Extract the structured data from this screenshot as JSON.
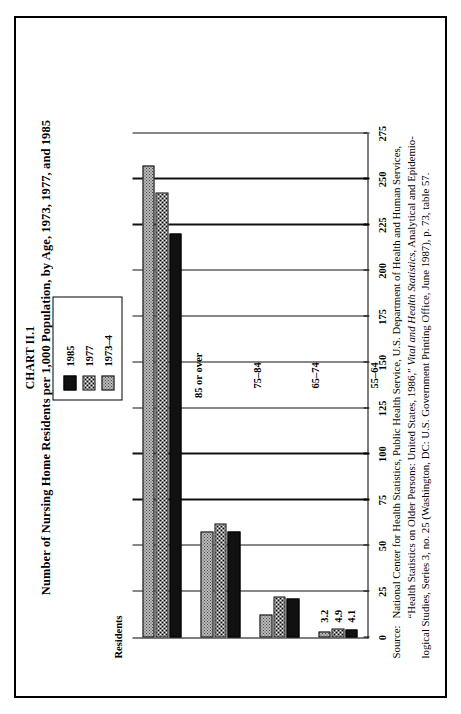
{
  "figure": {
    "chart_number": "CHART II.1",
    "title": "Number of Nursing Home Residents per 1,000 Population, by Age, 1973, 1977, and 1985",
    "axis_label": "Residents",
    "source_keyword": "Source:",
    "source_line1_a": "National Center for Health Statistics, Public Health Service, U.S. Department of Health and Human Services,",
    "source_line2_a": "“Health Statistics on Older Persons: United States, 1986,” ",
    "source_line2_italic": "Vital and Health Statistics",
    "source_line2_b": ", Analytical and Epidemio-",
    "source_line3_a": "logical Studies, Series 3, no. 25 (Washington, DC: U.S. Government Printing Office, June 1987), p. 73, table 57."
  },
  "legend": {
    "items": [
      {
        "label": "1985",
        "swatch": "solid-black-swatch",
        "color": "#111111"
      },
      {
        "label": "1977",
        "swatch": "fine-dot-swatch",
        "color": "#ffffff"
      },
      {
        "label": "1973–4",
        "swatch": "gray-stipple-swatch",
        "color": "#b9b9b9"
      }
    ]
  },
  "chart_data": {
    "type": "bar",
    "orientation": "horizontal",
    "title": "Number of Nursing Home Residents per 1,000 Population, by Age, 1973, 1977, and 1985",
    "xlabel": "",
    "ylabel": "Residents",
    "ylim": [
      0,
      275
    ],
    "yticks": [
      0,
      25,
      50,
      75,
      100,
      125,
      150,
      175,
      200,
      225,
      250,
      275
    ],
    "ticklabels": [
      "0",
      "25",
      "50",
      "75",
      "100",
      "125",
      "150",
      "175",
      "200",
      "225",
      "250",
      "275"
    ],
    "grid": true,
    "legend_position": "top-right",
    "categories": [
      "55–64",
      "65–74",
      "75–84",
      "85 or over"
    ],
    "series": [
      {
        "name": "1985",
        "values": [
          4.1,
          21.1,
          57.7,
          220.3
        ]
      },
      {
        "name": "1977",
        "values": [
          4.9,
          22.5,
          62.0,
          243.0
        ]
      },
      {
        "name": "1973–4",
        "values": [
          3.2,
          12.3,
          57.7,
          257.3
        ]
      }
    ],
    "point_labels": {
      "55–64": {
        "1985": "4.1",
        "1977": "4.9",
        "1973–4": "3.2"
      }
    }
  }
}
